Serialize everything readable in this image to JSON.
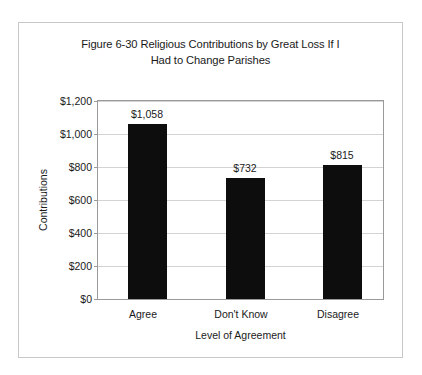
{
  "chart_data": {
    "type": "bar",
    "title": "Figure 6-30 Religious Contributions by Great Loss If I Had to Change Parishes",
    "title_line1": "Figure 6-30 Religious Contributions by Great Loss If I",
    "title_line2": "Had to Change Parishes",
    "categories": [
      "Agree",
      "Don't Know",
      "Disagree"
    ],
    "values": [
      1058,
      732,
      815
    ],
    "value_labels": [
      "$1,058",
      "$732",
      "$815"
    ],
    "xlabel": "Level of Agreement",
    "ylabel": "Contributions",
    "ylim": [
      0,
      1200
    ],
    "ytick_values": [
      0,
      200,
      400,
      600,
      800,
      1000,
      1200
    ],
    "ytick_labels": [
      "$0",
      "$200",
      "$400",
      "$600",
      "$800",
      "$1,000",
      "$1,200"
    ],
    "grid": true,
    "legend": "none",
    "bar_color": "#0d0d0d",
    "plot_border_color": "#9a9a9a",
    "gridline_color": "#d3d3d3",
    "frame_border_color": "#c8c8c8",
    "background_color": "#ffffff"
  }
}
